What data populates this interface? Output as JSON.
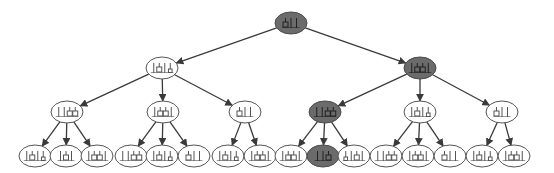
{
  "diagram": {
    "type": "tree",
    "title": "Search tree of block-stacking states",
    "colors": {
      "highlight_fill": "#6b6b6b",
      "normal_fill": "#ffffff",
      "edge": "#3a3a3a"
    },
    "nodes": [
      {
        "id": "n0",
        "level": 0,
        "x": 291,
        "y": 23,
        "highlighted": true,
        "state": "box-stick-stick"
      },
      {
        "id": "n1",
        "level": 1,
        "x": 162,
        "y": 68,
        "highlighted": false,
        "state": "stick-box-stick-flask"
      },
      {
        "id": "n2",
        "level": 1,
        "x": 420,
        "y": 68,
        "highlighted": true,
        "state": "stick-box-box-stick"
      },
      {
        "id": "n3",
        "level": 2,
        "x": 67,
        "y": 112,
        "highlighted": false,
        "state": "stick-stick-box-box"
      },
      {
        "id": "n4",
        "level": 2,
        "x": 163,
        "y": 112,
        "highlighted": false,
        "state": "stick-box-box-stick"
      },
      {
        "id": "n5",
        "level": 2,
        "x": 245,
        "y": 112,
        "highlighted": false,
        "state": "box-stick-stick"
      },
      {
        "id": "n6",
        "level": 2,
        "x": 325,
        "y": 112,
        "highlighted": true,
        "state": "stick-stick-box-box"
      },
      {
        "id": "n7",
        "level": 2,
        "x": 420,
        "y": 112,
        "highlighted": false,
        "state": "stick-box-stick-flask"
      },
      {
        "id": "n8",
        "level": 2,
        "x": 502,
        "y": 112,
        "highlighted": false,
        "state": "box-stick-stick"
      },
      {
        "id": "n9",
        "level": 3,
        "x": 35,
        "y": 156,
        "highlighted": false,
        "state": "stick-box-stick-flask"
      },
      {
        "id": "n10",
        "level": 3,
        "x": 66,
        "y": 156,
        "highlighted": false,
        "state": "stick-box-stick"
      },
      {
        "id": "n11",
        "level": 3,
        "x": 97,
        "y": 156,
        "highlighted": false,
        "state": "stick-box-box-stick"
      },
      {
        "id": "n12",
        "level": 3,
        "x": 131,
        "y": 156,
        "highlighted": false,
        "state": "stick-stick-box-box"
      },
      {
        "id": "n13",
        "level": 3,
        "x": 162,
        "y": 156,
        "highlighted": false,
        "state": "stick-box-stick-flask"
      },
      {
        "id": "n14",
        "level": 3,
        "x": 194,
        "y": 156,
        "highlighted": false,
        "state": "box-stick-stick"
      },
      {
        "id": "n15",
        "level": 3,
        "x": 228,
        "y": 156,
        "highlighted": false,
        "state": "stick-box-stick-flask"
      },
      {
        "id": "n16",
        "level": 3,
        "x": 260,
        "y": 156,
        "highlighted": false,
        "state": "stick-box-box-stick"
      },
      {
        "id": "n17",
        "level": 3,
        "x": 291,
        "y": 156,
        "highlighted": false,
        "state": "stick-box-box-stick"
      },
      {
        "id": "n18",
        "level": 3,
        "x": 323,
        "y": 156,
        "highlighted": true,
        "state": "stick-stick-box"
      },
      {
        "id": "n19",
        "level": 3,
        "x": 354,
        "y": 156,
        "highlighted": false,
        "state": "flask-stick-box-stick"
      },
      {
        "id": "n20",
        "level": 3,
        "x": 386,
        "y": 156,
        "highlighted": false,
        "state": "stick-stick-box-box"
      },
      {
        "id": "n21",
        "level": 3,
        "x": 418,
        "y": 156,
        "highlighted": false,
        "state": "stick-box-box-stick"
      },
      {
        "id": "n22",
        "level": 3,
        "x": 450,
        "y": 156,
        "highlighted": false,
        "state": "box-stick-stick"
      },
      {
        "id": "n23",
        "level": 3,
        "x": 482,
        "y": 156,
        "highlighted": false,
        "state": "stick-box-stick-flask"
      },
      {
        "id": "n24",
        "level": 3,
        "x": 514,
        "y": 156,
        "highlighted": false,
        "state": "stick-box-box-stick"
      }
    ],
    "edges": [
      [
        "n0",
        "n1"
      ],
      [
        "n0",
        "n2"
      ],
      [
        "n1",
        "n3"
      ],
      [
        "n1",
        "n4"
      ],
      [
        "n1",
        "n5"
      ],
      [
        "n2",
        "n6"
      ],
      [
        "n2",
        "n7"
      ],
      [
        "n2",
        "n8"
      ],
      [
        "n3",
        "n9"
      ],
      [
        "n3",
        "n10"
      ],
      [
        "n3",
        "n11"
      ],
      [
        "n4",
        "n12"
      ],
      [
        "n4",
        "n13"
      ],
      [
        "n4",
        "n14"
      ],
      [
        "n5",
        "n15"
      ],
      [
        "n5",
        "n16"
      ],
      [
        "n6",
        "n17"
      ],
      [
        "n6",
        "n18"
      ],
      [
        "n6",
        "n19"
      ],
      [
        "n7",
        "n20"
      ],
      [
        "n7",
        "n21"
      ],
      [
        "n7",
        "n22"
      ],
      [
        "n8",
        "n23"
      ],
      [
        "n8",
        "n24"
      ]
    ],
    "node_rx": 16,
    "node_ry": 11
  }
}
